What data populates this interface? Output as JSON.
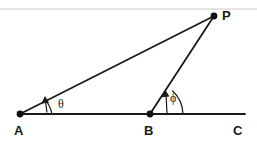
{
  "figure": {
    "background_color": "#ffffff",
    "stroke_color": "#1a1a1a",
    "rule_color": "#d8d8d8",
    "width": 257,
    "height": 150
  },
  "top_rule": {
    "name": "top-divider",
    "y": 9,
    "color": "#dcdcdc"
  },
  "points": [
    {
      "id": "A",
      "label": "A",
      "x": 20,
      "y": 114,
      "label_x": 19,
      "label_y": 132,
      "has_dot": true
    },
    {
      "id": "B",
      "label": "B",
      "x": 150,
      "y": 114,
      "label_x": 147,
      "label_y": 132,
      "has_dot": true
    },
    {
      "id": "C",
      "label": "C",
      "x": 245,
      "y": 114,
      "label_x": 234,
      "label_y": 132,
      "has_dot": false
    },
    {
      "id": "P",
      "label": "P",
      "x": 214,
      "y": 16,
      "label_x": 222,
      "label_y": 19,
      "has_dot": true
    }
  ],
  "segments": [
    {
      "name": "baseline-AC",
      "from": "A",
      "to": "C",
      "x1": 20,
      "y1": 114,
      "x2": 245,
      "y2": 114,
      "width": 1.8
    },
    {
      "name": "line-AP",
      "from": "A",
      "to": "P",
      "x1": 20,
      "y1": 114,
      "x2": 214,
      "y2": 16,
      "width": 1.8
    },
    {
      "name": "line-BP",
      "from": "B",
      "to": "P",
      "x1": 150,
      "y1": 114,
      "x2": 214,
      "y2": 16,
      "width": 1.8
    }
  ],
  "angles": [
    {
      "id": "theta",
      "symbol": "θ",
      "at_vertex": "A",
      "label_x": 60,
      "label_y": 107,
      "arc_path": "M 52 114 A 32 32 0 0 0 45.5 100.2",
      "arrow_path": "M 47 112 L 45 99.5",
      "arrow_head": "45,96.5 41.6,103.4 48.8,103.0"
    },
    {
      "id": "phi",
      "symbol": "ϕ",
      "at_vertex": "B",
      "label_x": 172,
      "label_y": 101,
      "arc_path": "M 183 114 A 33 33 0 0 0 172.5 90.3",
      "arrow_path": "M 167 113 L 166 93",
      "arrow_head": "165.5,89.5 161.8,96.8 169.5,96.4"
    }
  ]
}
